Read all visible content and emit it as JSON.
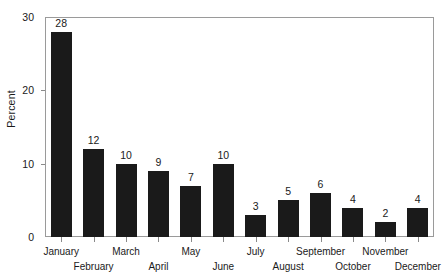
{
  "chart_data": {
    "type": "bar",
    "title": "",
    "xlabel": "",
    "ylabel": "Percent",
    "categories": [
      "January",
      "February",
      "March",
      "April",
      "May",
      "June",
      "July",
      "August",
      "September",
      "October",
      "November",
      "December"
    ],
    "values": [
      28,
      12,
      10,
      9,
      7,
      10,
      3,
      5,
      6,
      4,
      2,
      4
    ],
    "value_labels": [
      "28",
      "12",
      "10",
      "9",
      "7",
      "10",
      "3",
      "5",
      "6",
      "4",
      "2",
      "4"
    ],
    "ylim": [
      0,
      30
    ],
    "y_ticks": [
      0,
      10,
      20,
      30
    ],
    "y_tick_labels": [
      "0",
      "10",
      "20",
      "30"
    ],
    "grid": false,
    "legend": null,
    "bar_color": "#1a1a1a",
    "frame_color": "#9a9a9a",
    "background": "#ffffff",
    "label_rows": [
      "top",
      "bottom",
      "top",
      "bottom",
      "top",
      "bottom",
      "top",
      "bottom",
      "top",
      "bottom",
      "top",
      "bottom"
    ]
  }
}
